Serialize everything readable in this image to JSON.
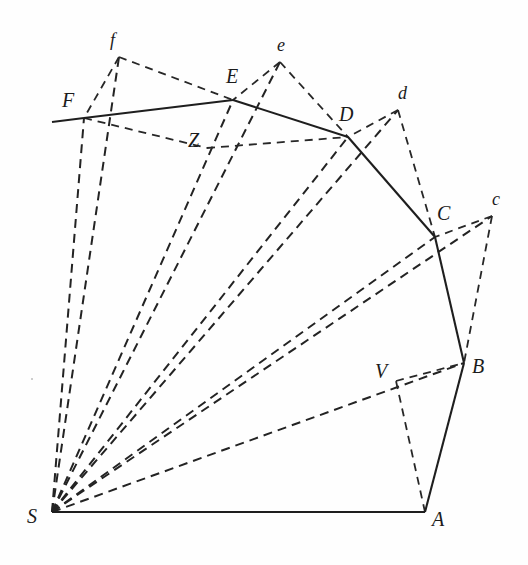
{
  "figure": {
    "background_color": "#fefefe",
    "ink_color": "#1e1e1e",
    "width": 528,
    "height": 565
  },
  "points": {
    "S": {
      "label": "S",
      "x": 52,
      "y": 512,
      "label_x": 27,
      "label_y": 506,
      "kind": "upper"
    },
    "A": {
      "label": "A",
      "x": 425,
      "y": 512,
      "label_x": 432,
      "label_y": 509,
      "kind": "upper"
    },
    "B": {
      "label": "B",
      "x": 464,
      "y": 363,
      "label_x": 472,
      "label_y": 356,
      "kind": "upper"
    },
    "C": {
      "label": "C",
      "x": 435,
      "y": 237,
      "label_x": 437,
      "label_y": 203,
      "kind": "upper"
    },
    "D": {
      "label": "D",
      "x": 348,
      "y": 137,
      "label_x": 339,
      "label_y": 104,
      "kind": "upper"
    },
    "E": {
      "label": "E",
      "x": 233,
      "y": 100,
      "label_x": 226,
      "label_y": 66,
      "kind": "upper"
    },
    "F": {
      "label": "F",
      "x": 84,
      "y": 118,
      "label_x": 62,
      "label_y": 90,
      "kind": "upper"
    },
    "V": {
      "label": "V",
      "x": 396,
      "y": 381,
      "label_x": 375,
      "label_y": 361,
      "kind": "upper"
    },
    "Z": {
      "label": "Z",
      "x": 207,
      "y": 148,
      "label_x": 188,
      "label_y": 130,
      "kind": "upper"
    },
    "c": {
      "label": "c",
      "x": 492,
      "y": 216,
      "label_x": 492,
      "label_y": 190,
      "kind": "lower"
    },
    "d": {
      "label": "d",
      "x": 398,
      "y": 110,
      "label_x": 398,
      "label_y": 84,
      "kind": "lower"
    },
    "e": {
      "label": "e",
      "x": 280,
      "y": 62,
      "label_x": 277,
      "label_y": 36,
      "kind": "lower"
    },
    "f": {
      "label": "f",
      "x": 119,
      "y": 57,
      "label_x": 110,
      "label_y": 31,
      "kind": "lower"
    },
    "Fleft": {
      "label": "",
      "x": 52,
      "y": 122,
      "label_x": 0,
      "label_y": 0,
      "kind": "anchor"
    }
  },
  "solid_edges": [
    {
      "name": "edge-S-A",
      "from": "S",
      "to": "A"
    },
    {
      "name": "edge-A-B",
      "from": "A",
      "to": "B"
    },
    {
      "name": "edge-B-C",
      "from": "B",
      "to": "C"
    },
    {
      "name": "edge-C-D",
      "from": "C",
      "to": "D"
    },
    {
      "name": "edge-D-E",
      "from": "D",
      "to": "E"
    },
    {
      "name": "edge-E-F",
      "from": "E",
      "to": "F"
    },
    {
      "name": "edge-F-left-extension",
      "from": "F",
      "to": "Fleft"
    }
  ],
  "dashed_rays": [
    {
      "name": "ray-S-to-c",
      "from": "S",
      "to": "c"
    },
    {
      "name": "ray-S-to-d",
      "from": "S",
      "to": "d"
    },
    {
      "name": "ray-S-to-e",
      "from": "S",
      "to": "e"
    },
    {
      "name": "ray-S-to-f",
      "from": "S",
      "to": "f"
    },
    {
      "name": "ray-S-to-B",
      "from": "S",
      "to": "B"
    },
    {
      "name": "ray-S-to-C",
      "from": "S",
      "to": "C"
    },
    {
      "name": "ray-S-to-D",
      "from": "S",
      "to": "D"
    },
    {
      "name": "ray-S-to-E",
      "from": "S",
      "to": "E"
    },
    {
      "name": "ray-S-to-F",
      "from": "S",
      "to": "F"
    }
  ],
  "dashed_chords": [
    {
      "name": "chord-c-to-B",
      "from": "c",
      "to": "B"
    },
    {
      "name": "chord-c-to-C",
      "from": "c",
      "to": "C"
    },
    {
      "name": "chord-d-to-C",
      "from": "d",
      "to": "C"
    },
    {
      "name": "chord-d-to-D",
      "from": "d",
      "to": "D"
    },
    {
      "name": "chord-e-to-D",
      "from": "e",
      "to": "D"
    },
    {
      "name": "chord-e-to-E",
      "from": "e",
      "to": "E"
    },
    {
      "name": "chord-f-to-E",
      "from": "f",
      "to": "E"
    },
    {
      "name": "chord-f-to-F",
      "from": "f",
      "to": "F"
    },
    {
      "name": "chord-V-to-B",
      "from": "V",
      "to": "B"
    },
    {
      "name": "chord-Z-to-D",
      "from": "Z",
      "to": "D"
    },
    {
      "name": "chord-F-to-Z",
      "from": "F",
      "to": "Z"
    },
    {
      "name": "chord-A-to-V",
      "from": "A",
      "to": "V"
    }
  ],
  "annotations": {
    "upper_vertices": [
      "S",
      "A",
      "B",
      "C",
      "D",
      "E",
      "F"
    ],
    "lower_vertices": [
      "c",
      "d",
      "e",
      "f"
    ],
    "interior_marks": [
      "V",
      "Z"
    ]
  }
}
